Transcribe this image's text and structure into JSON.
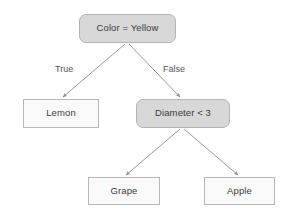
{
  "diagram": {
    "type": "decision-tree",
    "title": "",
    "background_color": "#ffffff",
    "decision_node_fill": "#d8d8d8",
    "decision_node_border": "#b4b4b4",
    "leaf_node_fill": "#fafafa",
    "leaf_node_border": "#b9b9b9",
    "edge_color": "#9a9a9a",
    "text_color": "#3b3b3b",
    "label_color": "#555555"
  },
  "nodes": [
    {
      "id": "root",
      "label": "Color = Yellow",
      "kind": "decision",
      "x": 79,
      "y": 14,
      "w": 97,
      "h": 29
    },
    {
      "id": "lemon",
      "label": "Lemon",
      "kind": "leaf",
      "x": 23,
      "y": 99,
      "w": 76,
      "h": 29
    },
    {
      "id": "diameter",
      "label": "Diameter < 3",
      "kind": "decision",
      "x": 136,
      "y": 99,
      "w": 94,
      "h": 29
    },
    {
      "id": "grape",
      "label": "Grape",
      "kind": "leaf",
      "x": 88,
      "y": 177,
      "w": 72,
      "h": 28
    },
    {
      "id": "apple",
      "label": "Apple",
      "kind": "leaf",
      "x": 204,
      "y": 177,
      "w": 71,
      "h": 28
    }
  ],
  "edges": [
    {
      "id": "root-true",
      "from": "root",
      "to": "lemon",
      "label": "True",
      "label_x": 55,
      "label_y": 64,
      "x1": 125,
      "y1": 44,
      "x2": 63,
      "y2": 97
    },
    {
      "id": "root-false",
      "from": "root",
      "to": "diameter",
      "label": "False",
      "label_x": 163,
      "label_y": 64,
      "x1": 129,
      "y1": 44,
      "x2": 180,
      "y2": 97
    },
    {
      "id": "diameter-left",
      "from": "diameter",
      "to": "grape",
      "label": "",
      "label_x": 0,
      "label_y": 0,
      "x1": 180,
      "y1": 129,
      "x2": 126,
      "y2": 175
    },
    {
      "id": "diameter-right",
      "from": "diameter",
      "to": "apple",
      "label": "",
      "label_x": 0,
      "label_y": 0,
      "x1": 184,
      "y1": 129,
      "x2": 238,
      "y2": 175
    }
  ]
}
